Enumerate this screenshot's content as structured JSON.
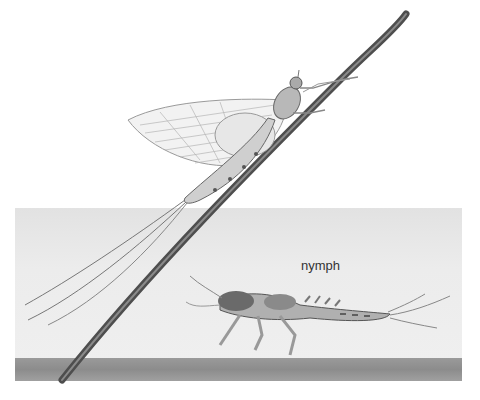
{
  "illustration": {
    "subject": "mayfly life stages",
    "labels": {
      "nymph": "nymph"
    },
    "colors": {
      "background": "#ffffff",
      "water": "#e8e8e8",
      "ground": "#8e8e8e",
      "stem": "#5a5a5a",
      "label_text": "#333333"
    }
  }
}
